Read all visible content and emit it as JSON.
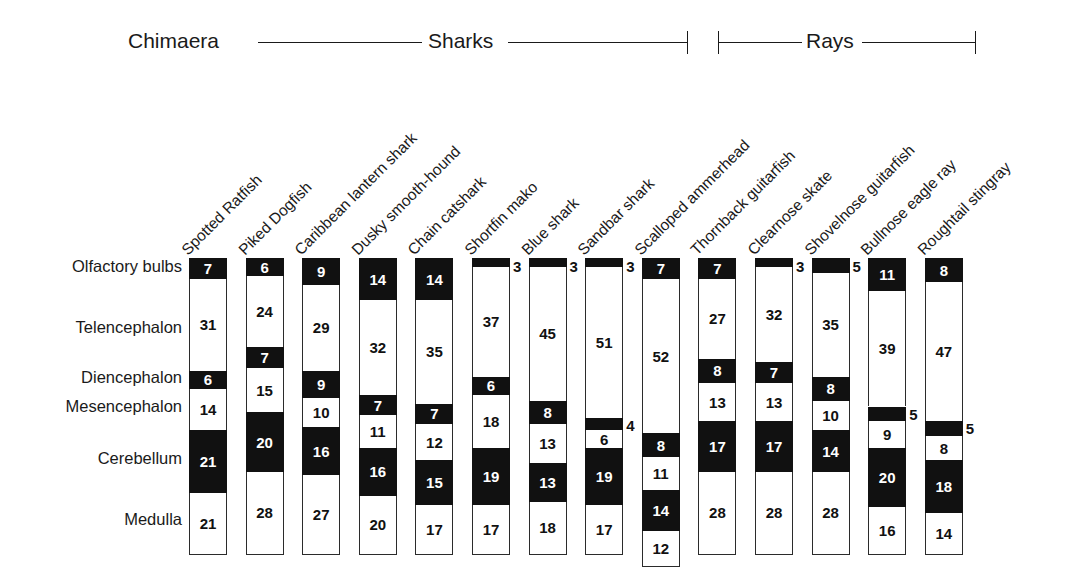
{
  "figure": {
    "bar_total": 100,
    "ink": "#111111",
    "paper": "#ffffff"
  },
  "clades": [
    {
      "name": "Chimaera",
      "label": "Chimaera"
    },
    {
      "name": "Sharks",
      "label": "Sharks"
    },
    {
      "name": "Rays",
      "label": "Rays"
    }
  ],
  "regions": [
    {
      "key": "olfactory_bulbs",
      "label": "Olfactory bulbs",
      "shade": "dark"
    },
    {
      "key": "telencephalon",
      "label": "Telencephalon",
      "shade": "light"
    },
    {
      "key": "diencephalon",
      "label": "Diencephalon",
      "shade": "dark"
    },
    {
      "key": "mesencephalon",
      "label": "Mesencephalon",
      "shade": "light"
    },
    {
      "key": "cerebellum",
      "label": "Cerebellum",
      "shade": "dark"
    },
    {
      "key": "medulla",
      "label": "Medulla",
      "shade": "light"
    }
  ],
  "species": [
    "Spotted Ratfish",
    "Piked Dogfish",
    "Caribbean lantern shark",
    "Dusky smooth-hound",
    "Chain catshark",
    "Shortfin mako",
    "Blue shark",
    "Sandbar shark",
    "Scalloped ammerhead",
    "Thornback guitarfish",
    "Clearnose skate",
    "Shovelnose guitarfish",
    "Bullnose eagle ray",
    "Roughtail stingray"
  ],
  "chart_data": {
    "type": "bar",
    "subtype": "stacked-100-percent",
    "xlabel": "",
    "ylabel": "",
    "ylim": [
      0,
      100
    ],
    "grid": false,
    "legend": "none",
    "orientation": "vertical",
    "categories": [
      "Spotted Ratfish",
      "Piked Dogfish",
      "Caribbean lantern shark",
      "Dusky smooth-hound",
      "Chain catshark",
      "Shortfin mako",
      "Blue shark",
      "Sandbar shark",
      "Scalloped ammerhead",
      "Thornback guitarfish",
      "Clearnose skate",
      "Shovelnose guitarfish",
      "Bullnose eagle ray",
      "Roughtail stingray"
    ],
    "category_groups": [
      "Chimaera",
      "Sharks",
      "Sharks",
      "Sharks",
      "Sharks",
      "Sharks",
      "Sharks",
      "Sharks",
      "Sharks",
      "Rays",
      "Rays",
      "Rays",
      "Rays",
      "Rays"
    ],
    "series": [
      {
        "name": "Olfactory bulbs",
        "shade": "dark",
        "values": [
          7,
          6,
          9,
          14,
          14,
          3,
          3,
          3,
          7,
          7,
          3,
          5,
          11,
          8
        ]
      },
      {
        "name": "Telencephalon",
        "shade": "light",
        "values": [
          31,
          24,
          29,
          32,
          35,
          37,
          45,
          51,
          52,
          27,
          32,
          35,
          39,
          47
        ]
      },
      {
        "name": "Diencephalon",
        "shade": "dark",
        "values": [
          6,
          7,
          9,
          7,
          7,
          6,
          8,
          4,
          8,
          8,
          7,
          8,
          5,
          5
        ]
      },
      {
        "name": "Mesencephalon",
        "shade": "light",
        "values": [
          14,
          15,
          10,
          11,
          12,
          18,
          13,
          6,
          11,
          13,
          13,
          10,
          9,
          8
        ]
      },
      {
        "name": "Cerebellum",
        "shade": "dark",
        "values": [
          21,
          20,
          16,
          16,
          15,
          19,
          13,
          19,
          14,
          17,
          17,
          14,
          20,
          18
        ]
      },
      {
        "name": "Medulla",
        "shade": "light",
        "values": [
          21,
          28,
          27,
          20,
          17,
          17,
          18,
          17,
          12,
          28,
          28,
          28,
          16,
          14
        ]
      }
    ],
    "value_label_placement": {
      "note": "Values rendered inside their segment unless the segment is too short; short segments carry the number outside, to the right of the bar.",
      "outside": [
        {
          "species": "Shortfin mako",
          "region": "Olfactory bulbs",
          "value": 3
        },
        {
          "species": "Blue shark",
          "region": "Olfactory bulbs",
          "value": 3
        },
        {
          "species": "Sandbar shark",
          "region": "Olfactory bulbs",
          "value": 3
        },
        {
          "species": "Sandbar shark",
          "region": "Diencephalon",
          "value": 4
        },
        {
          "species": "Clearnose skate",
          "region": "Olfactory bulbs",
          "value": 3
        },
        {
          "species": "Shovelnose guitarfish",
          "region": "Olfactory bulbs",
          "value": 5
        },
        {
          "species": "Bullnose eagle ray",
          "region": "Diencephalon",
          "value": 5
        },
        {
          "species": "Roughtail stingray",
          "region": "Diencephalon",
          "value": 5
        }
      ]
    }
  }
}
